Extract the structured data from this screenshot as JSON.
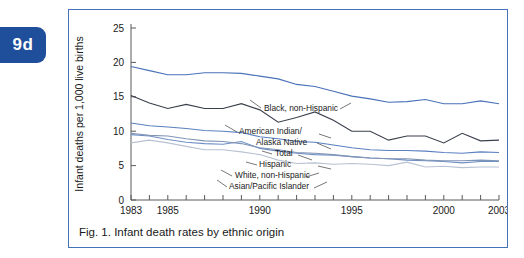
{
  "badge": {
    "label": "9d"
  },
  "figure": {
    "caption": "Fig. 1. Infant death rates by ethnic origin",
    "border_color": "#4472B8"
  },
  "chart_data": {
    "type": "line",
    "title": "",
    "xlabel": "",
    "ylabel": "Infant deaths per 1,000 live births",
    "xlim": [
      1983,
      2003
    ],
    "ylim": [
      0,
      25
    ],
    "yticks": [
      0,
      5,
      10,
      15,
      20,
      25
    ],
    "xticks": [
      1983,
      1984,
      1985,
      1986,
      1987,
      1988,
      1989,
      1990,
      1991,
      1992,
      1993,
      1994,
      1995,
      1996,
      1997,
      1998,
      1999,
      2000,
      2001,
      2002,
      2003
    ],
    "xticklabels_shown": [
      "1983",
      "1985",
      "1990",
      "1995",
      "2000",
      "2003"
    ],
    "grid": false,
    "legend_position": "inline-labels",
    "x": [
      1983,
      1984,
      1985,
      1986,
      1987,
      1988,
      1989,
      1990,
      1991,
      1992,
      1993,
      1994,
      1995,
      1996,
      1997,
      1998,
      1999,
      2000,
      2001,
      2002,
      2003
    ],
    "series": [
      {
        "name": "Black, non-Hispanic",
        "color": "#4A72B8",
        "values": [
          19.4,
          18.8,
          18.2,
          18.2,
          18.5,
          18.5,
          18.4,
          18.0,
          17.6,
          16.8,
          16.5,
          15.8,
          15.1,
          14.7,
          14.2,
          14.3,
          14.6,
          14.0,
          14.0,
          14.4,
          14.0
        ]
      },
      {
        "name": "American Indian/Alaska Native",
        "color": "#3A3F4C",
        "values": [
          15.2,
          14.1,
          13.3,
          13.9,
          13.3,
          13.3,
          14.0,
          13.1,
          11.3,
          12.0,
          12.8,
          11.6,
          10.0,
          10.0,
          8.7,
          9.3,
          9.3,
          8.3,
          9.7,
          8.6,
          8.7
        ]
      },
      {
        "name": "Total",
        "color": "#5A80C0",
        "values": [
          11.2,
          10.8,
          10.6,
          10.4,
          10.1,
          10.0,
          9.8,
          9.2,
          8.9,
          8.5,
          8.4,
          8.0,
          7.6,
          7.3,
          7.2,
          7.2,
          7.1,
          6.9,
          6.8,
          7.0,
          6.9
        ]
      },
      {
        "name": "Hispanic",
        "color": "#6E8FC6",
        "values": [
          9.5,
          9.3,
          8.8,
          8.4,
          8.2,
          8.1,
          8.5,
          7.5,
          7.1,
          6.8,
          6.6,
          6.5,
          6.3,
          6.1,
          6.0,
          5.8,
          5.7,
          5.6,
          5.4,
          5.6,
          5.6
        ]
      },
      {
        "name": "White, non-Hispanic",
        "color": "#8094B4",
        "values": [
          9.7,
          9.4,
          9.3,
          8.9,
          8.6,
          8.5,
          8.2,
          7.6,
          7.3,
          6.9,
          6.8,
          6.6,
          6.3,
          6.1,
          6.0,
          6.0,
          5.8,
          5.7,
          5.7,
          5.8,
          5.7
        ]
      },
      {
        "name": "Asian/Pacific Islander",
        "color": "#B8C2D2",
        "values": [
          8.3,
          8.7,
          8.3,
          7.8,
          7.3,
          7.3,
          7.0,
          6.6,
          5.8,
          5.3,
          5.4,
          5.2,
          5.3,
          5.2,
          5.0,
          5.5,
          4.8,
          4.9,
          4.7,
          4.8,
          4.8
        ]
      }
    ],
    "inline_labels": [
      {
        "text": "Black, non-Hispanic",
        "x": 195,
        "y": 101
      },
      {
        "text": "American Indian/",
        "x": 170,
        "y": 124
      },
      {
        "text": "Alaska Native",
        "x": 187,
        "y": 135
      },
      {
        "text": "Total",
        "x": 206,
        "y": 146
      },
      {
        "text": "Hispanic",
        "x": 190,
        "y": 157
      },
      {
        "text": "White, non-Hispanic",
        "x": 166,
        "y": 168
      },
      {
        "text": "Asian/Pacific Islander",
        "x": 160,
        "y": 179
      }
    ]
  }
}
